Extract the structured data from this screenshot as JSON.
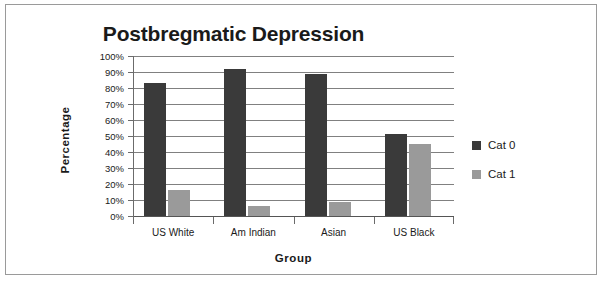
{
  "chart_data": {
    "type": "bar",
    "title": "Postbregmatic Depression",
    "xlabel": "Group",
    "ylabel": "Percentage",
    "categories": [
      "US White",
      "Am Indian",
      "Asian",
      "US Black"
    ],
    "series": [
      {
        "name": "Cat 0",
        "color": "#3a3a3a",
        "values": [
          83,
          92,
          89,
          51
        ]
      },
      {
        "name": "Cat 1",
        "color": "#9a9a9a",
        "values": [
          16,
          6,
          9,
          45
        ]
      }
    ],
    "ylim": [
      0,
      100
    ],
    "ytick_labels": [
      "100%",
      "90%",
      "80%",
      "70%",
      "60%",
      "50%",
      "40%",
      "30%",
      "20%",
      "10%",
      "0%"
    ],
    "ytick_values": [
      100,
      90,
      80,
      70,
      60,
      50,
      40,
      30,
      20,
      10,
      0
    ],
    "grid": true,
    "legend_position": "right",
    "value_suffix": "%"
  },
  "frame": {
    "border_color": "#9a9a9a",
    "background": "#ffffff"
  }
}
